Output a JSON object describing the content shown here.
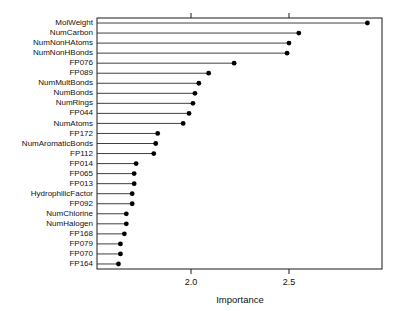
{
  "chart_data": {
    "type": "scatter",
    "title": "",
    "subtitle": "",
    "xlabel": "Importance",
    "ylabel": "",
    "xlim": [
      1.555,
      2.975
    ],
    "ylim": [
      0,
      25
    ],
    "grid": false,
    "legend": null,
    "xticks": [
      2.0,
      2.5
    ],
    "xtick_labels": [
      "2.0",
      "2.5"
    ],
    "xticks_top": [
      2.0,
      2.5
    ],
    "marker": "filled-circle",
    "stems": true,
    "categories": [
      "MolWeight",
      "NumCarbon",
      "NumNonHAtoms",
      "NumNonHBonds",
      "FP076",
      "FP089",
      "NumMultBonds",
      "NumBonds",
      "NumRings",
      "FP044",
      "NumAtoms",
      "FP172",
      "NumAromaticBonds",
      "FP112",
      "FP014",
      "FP065",
      "FP013",
      "HydrophilicFactor",
      "FP092",
      "NumChlorine",
      "NumHalogen",
      "FP168",
      "FP079",
      "FP070",
      "FP164"
    ],
    "values": [
      2.9,
      2.55,
      2.5,
      2.49,
      2.22,
      2.09,
      2.04,
      2.02,
      2.01,
      1.99,
      1.96,
      1.83,
      1.82,
      1.81,
      1.72,
      1.71,
      1.71,
      1.7,
      1.7,
      1.67,
      1.67,
      1.66,
      1.64,
      1.64,
      1.63
    ]
  }
}
